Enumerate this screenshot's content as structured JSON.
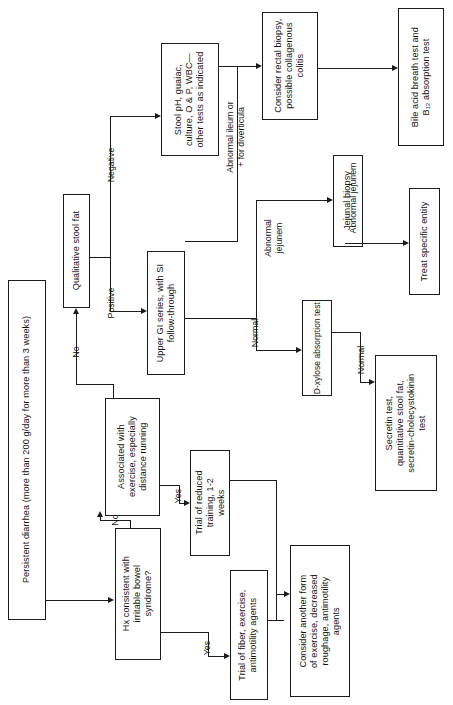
{
  "figure": {
    "kind": "clinical-algorithm-flowchart",
    "orientation": "rotated-90-ccw",
    "ink_color": "#1b1b1b",
    "background": "#ffffff"
  },
  "nodes": [
    {
      "id": "persistent-diarrhea",
      "label": "Persistent diarrhea (more than 200 g/day for more than 3 weeks)"
    },
    {
      "id": "hx-ibs",
      "label": "Hx consistent with\nirritable bowel\nsyndrome?"
    },
    {
      "id": "assoc-exercise",
      "label": "Associated with\nexercise, especially\ndistance running"
    },
    {
      "id": "qualitative-stool-fat",
      "label": "Qualitative stool fat"
    },
    {
      "id": "trial-fiber",
      "label": "Trial of fiber, exercise,\nantimotility agents"
    },
    {
      "id": "trial-reduced-training",
      "label": "Trial of reduced\ntraining, 1-2\nweeks"
    },
    {
      "id": "consider-another-form",
      "label": "Consider another form\nof exercise, decreased\nroughage, antimotility\nagents"
    },
    {
      "id": "upper-gi-series",
      "label": "Upper GI series, with SI\nfollow-through"
    },
    {
      "id": "stool-ph",
      "label": "Stool pH, guaiac,\nculture, O & P, WBC—\nother tests as indicated"
    },
    {
      "id": "rectal-biopsy",
      "label": "Consider rectal biopsy,\npossible collagenous\ncolitis"
    },
    {
      "id": "bile-acid-test",
      "label": "Bile acid breath test and\nB₁₂ absorption test"
    },
    {
      "id": "jejunal-biopsy",
      "label": "Jejunal biopsy"
    },
    {
      "id": "treat-specific-entity",
      "label": "Treat specific entity"
    },
    {
      "id": "d-xylose-test",
      "label": "D-xylose absorption test"
    },
    {
      "id": "secretin-test",
      "label": "Secretin test,\nquantitative stool fat,\nsecretin-cholecystokinin\ntest"
    }
  ],
  "edge_labels": {
    "ibs_no": "No",
    "ibs_yes": "Yes",
    "exercise_no": "No",
    "exercise_yes": "Yes",
    "stoolfat_positive": "Positive",
    "stoolfat_negative": "Negative",
    "abnormal_ileum": "Abnormal ileum or\n+ for diverticula",
    "ugi_abnormal_jejunem": "Abnormal\njejunem",
    "ugi_normal": "Normal",
    "jejunal_abnormal": "Abnormal jejunem",
    "xylose_normal_in": "Normal",
    "xylose_normal_out": "Normal"
  }
}
